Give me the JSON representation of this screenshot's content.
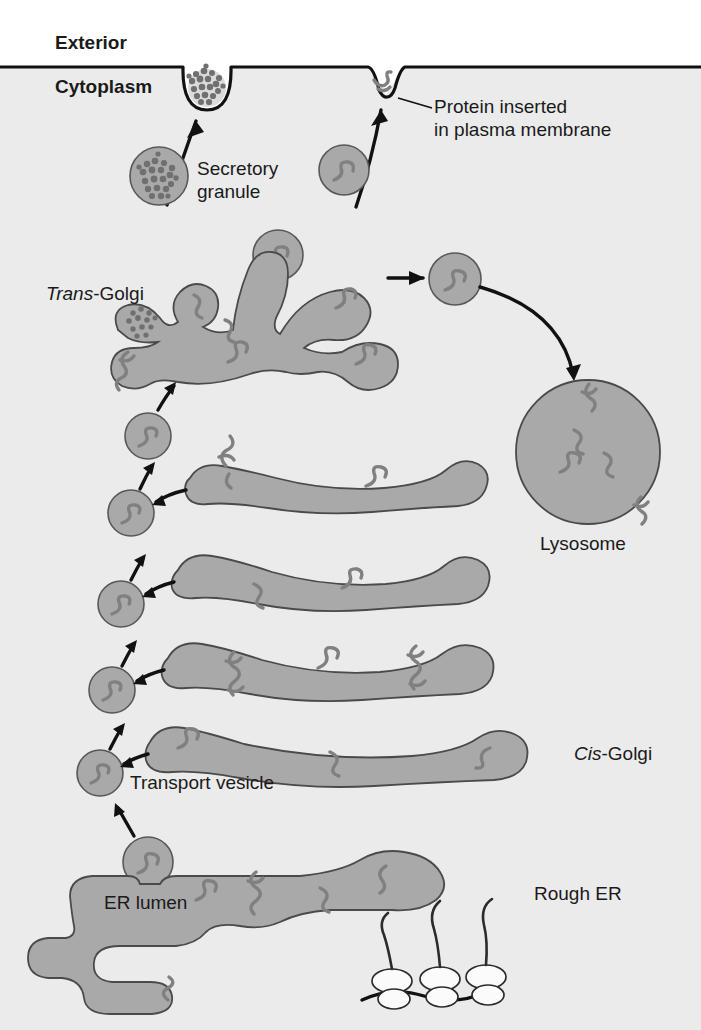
{
  "figure": {
    "colors": {
      "background": "#ffffff",
      "cytoplasm": "#ebebeb",
      "organelle_fill": "#a9a9a9",
      "organelle_stroke": "#4a4a4a",
      "cargo_squiggle": "#808080",
      "line_black": "#111111",
      "ribosome_fill": "#fbfbfb",
      "granule_dark": "#707070"
    }
  },
  "labels": {
    "exterior": "Exterior",
    "cytoplasm": "Cytoplasm",
    "protein_inserted_line1": "Protein inserted",
    "protein_inserted_line2": "in plasma membrane",
    "secretory_granule_line1": "Secretory",
    "secretory_granule_line2": "granule",
    "trans_golgi_italic": "Trans",
    "trans_golgi_rest": "-Golgi",
    "lysosome": "Lysosome",
    "cis_golgi_italic": "Cis",
    "cis_golgi_rest": "-Golgi",
    "transport_vesicle": "Transport vesicle",
    "er_lumen": "ER lumen",
    "rough_er": "Rough ER"
  },
  "structures": {
    "plasma_membrane": {
      "name": "plasma membrane",
      "fusion_dip": "rounded U-shaped invagination where secretory granule fuses",
      "insertion_dip": "narrow V-shaped notch holding an inserted membrane protein"
    },
    "golgi_stack": {
      "cisternae_count": 5,
      "order_bottom_to_top": [
        "cis-Golgi",
        "medial cisterna",
        "medial cisterna",
        "medial cisterna",
        "trans-Golgi network"
      ]
    },
    "vesicle_chain_count": 6,
    "lysosome": {
      "shape": "large circle",
      "internal_cargo": 3,
      "membrane_proteins": 2
    },
    "rough_er": {
      "ribosome_count": 3,
      "nascent_chain_count": 3
    },
    "secretory_granule": {
      "appearance": "dense speckled aggregate"
    }
  },
  "steps": [
    "Proteins are synthesized on ribosomes of the rough ER and enter the ER lumen",
    "Transport vesicles bud from the ER and carry cargo to the cis-Golgi",
    "Vesicles shuttle cargo upward through the Golgi cisternae",
    "At the trans-Golgi network cargo is sorted into secretory granules, lysosomes, or membrane vesicles",
    "Secretory granules fuse with the plasma membrane and release contents to the exterior",
    "Membrane vesicles fuse to insert proteins into the plasma membrane"
  ]
}
